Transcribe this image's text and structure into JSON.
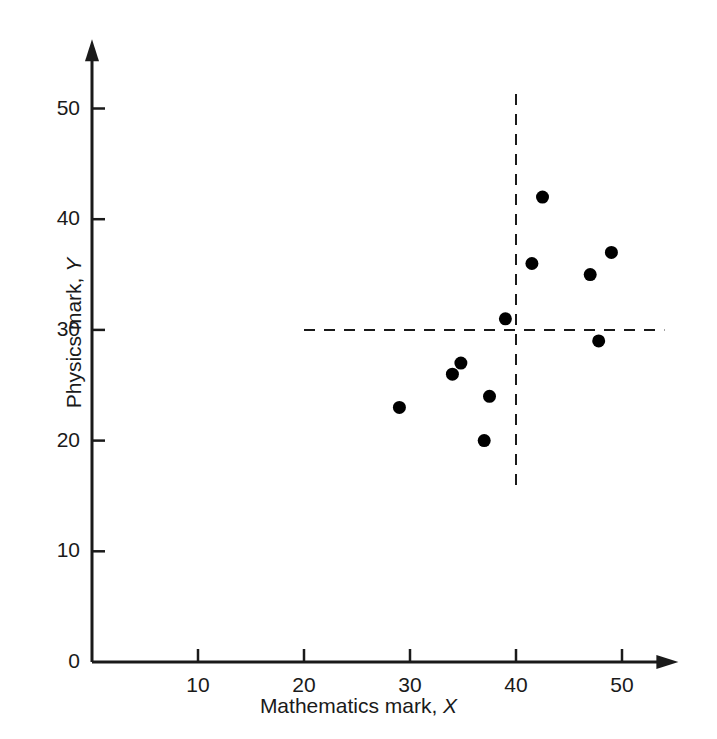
{
  "chart_data": {
    "type": "scatter",
    "title": "",
    "xlabel": "Mathematics mark, X",
    "xlabel_text": "Mathematics mark,",
    "xlabel_var": "X",
    "ylabel": "Physics mark, Y",
    "ylabel_text": "Physics mark,",
    "ylabel_var": "Y",
    "xlim": [
      0,
      54
    ],
    "ylim": [
      0,
      55
    ],
    "xticks": [
      10,
      20,
      30,
      40,
      50
    ],
    "yticks": [
      0,
      10,
      20,
      30,
      40,
      50
    ],
    "grid": false,
    "legend": "none",
    "marker": "filled-circle",
    "marker_color": "#000000",
    "axis_color": "#1a1a1a",
    "points": [
      {
        "x": 29,
        "y": 23
      },
      {
        "x": 34,
        "y": 26
      },
      {
        "x": 34.8,
        "y": 27
      },
      {
        "x": 37,
        "y": 20
      },
      {
        "x": 37.5,
        "y": 24
      },
      {
        "x": 39,
        "y": 31
      },
      {
        "x": 41.5,
        "y": 36
      },
      {
        "x": 42.5,
        "y": 42
      },
      {
        "x": 47,
        "y": 35
      },
      {
        "x": 47.8,
        "y": 29
      },
      {
        "x": 49,
        "y": 37
      }
    ],
    "reference_lines": [
      {
        "orientation": "horizontal",
        "value": 30,
        "style": "dashed",
        "label": "mean-y-line",
        "from": 20,
        "to": 54
      },
      {
        "orientation": "vertical",
        "value": 40,
        "style": "dashed",
        "label": "mean-x-line",
        "from": 16,
        "to": 52
      }
    ]
  }
}
